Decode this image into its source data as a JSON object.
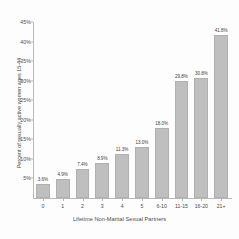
{
  "chart_data": {
    "type": "bar",
    "title": "",
    "subtitle": "",
    "categories": [
      "0",
      "1",
      "2",
      "3",
      "4",
      "5",
      "6-10",
      "11-15",
      "16-20",
      "21+"
    ],
    "values": [
      3.6,
      4.9,
      7.4,
      8.9,
      11.3,
      13.0,
      18.0,
      29.8,
      30.8,
      41.8
    ],
    "data_labels": [
      "3.6%",
      "4.9%",
      "7.4%",
      "8.9%",
      "11.3%",
      "13.0%",
      "18.0%",
      "29.8%",
      "30.8%",
      "41.8%"
    ],
    "xlabel": "Lifetime Non-Marital Sexual Partners",
    "ylabel": "Percent of sexually active women ages 15-44",
    "ylim": [
      0,
      45
    ],
    "ytick_labels": [
      "5%",
      "10%",
      "15%",
      "20%",
      "25%",
      "30%",
      "35%",
      "40%",
      "45%"
    ],
    "ytick_values": [
      5,
      10,
      15,
      20,
      25,
      30,
      35,
      40,
      45
    ],
    "grid": false,
    "legend": null,
    "bar_color": "#bfbfbf",
    "axis_color": "#b9b9b9",
    "text_color": "#4a4a4a"
  }
}
